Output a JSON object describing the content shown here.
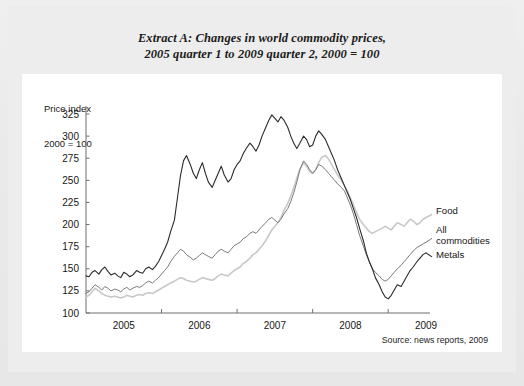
{
  "title": {
    "line1": "Extract A: Changes in world commodity prices,",
    "line2": "2005 quarter 1 to 2009 quarter 2, 2000 = 100"
  },
  "axis_caption": {
    "line1": "Price index",
    "line2": "2000 = 100"
  },
  "source": "Source: news reports, 2009",
  "chart_data": {
    "type": "line",
    "title": "Extract A: Changes in world commodity prices, 2005 quarter 1 to 2009 quarter 2, 2000 = 100",
    "xlabel": "",
    "ylabel": "Price index 2000 = 100",
    "ylim": [
      100,
      325
    ],
    "yticks": [
      100,
      125,
      150,
      175,
      200,
      225,
      250,
      275,
      300,
      325
    ],
    "xlim": [
      2005.0,
      2009.5
    ],
    "xticks": [
      2005,
      2006,
      2007,
      2008,
      2009
    ],
    "xtick_labels": [
      "2005",
      "2006",
      "2007",
      "2008",
      "2009"
    ],
    "grid": false,
    "legend_position": "inline-right",
    "series": [
      {
        "name": "Metals",
        "color": "#2b2b2b",
        "width": 1.1,
        "x": [
          2005.0,
          2005.04,
          2005.08,
          2005.12,
          2005.17,
          2005.21,
          2005.25,
          2005.29,
          2005.33,
          2005.38,
          2005.42,
          2005.46,
          2005.5,
          2005.54,
          2005.58,
          2005.62,
          2005.67,
          2005.71,
          2005.75,
          2005.79,
          2005.83,
          2005.88,
          2005.92,
          2005.96,
          2006.0,
          2006.04,
          2006.08,
          2006.12,
          2006.17,
          2006.21,
          2006.25,
          2006.29,
          2006.33,
          2006.38,
          2006.42,
          2006.46,
          2006.5,
          2006.54,
          2006.58,
          2006.62,
          2006.67,
          2006.71,
          2006.75,
          2006.79,
          2006.83,
          2006.88,
          2006.92,
          2006.96,
          2007.0,
          2007.04,
          2007.08,
          2007.12,
          2007.17,
          2007.21,
          2007.25,
          2007.29,
          2007.33,
          2007.38,
          2007.42,
          2007.46,
          2007.5,
          2007.54,
          2007.58,
          2007.62,
          2007.67,
          2007.71,
          2007.75,
          2007.79,
          2007.83,
          2007.88,
          2007.92,
          2007.96,
          2008.0,
          2008.04,
          2008.08,
          2008.12,
          2008.17,
          2008.21,
          2008.25,
          2008.29,
          2008.33,
          2008.38,
          2008.42,
          2008.46,
          2008.5,
          2008.54,
          2008.58,
          2008.62,
          2008.67,
          2008.71,
          2008.75,
          2008.79,
          2008.83,
          2008.88,
          2008.92,
          2008.96,
          2009.0,
          2009.04,
          2009.08,
          2009.12,
          2009.17,
          2009.21,
          2009.25,
          2009.29,
          2009.33,
          2009.38,
          2009.42,
          2009.46,
          2009.5
        ],
        "values": [
          142,
          141,
          146,
          148,
          144,
          149,
          152,
          147,
          143,
          145,
          142,
          140,
          146,
          144,
          141,
          143,
          148,
          146,
          145,
          150,
          152,
          149,
          153,
          158,
          165,
          172,
          180,
          192,
          205,
          230,
          255,
          272,
          278,
          268,
          258,
          252,
          262,
          270,
          258,
          248,
          242,
          250,
          258,
          266,
          256,
          248,
          252,
          262,
          268,
          272,
          280,
          286,
          292,
          288,
          283,
          290,
          300,
          310,
          318,
          324,
          320,
          316,
          322,
          318,
          310,
          300,
          292,
          286,
          292,
          300,
          296,
          288,
          290,
          300,
          306,
          302,
          296,
          288,
          280,
          272,
          262,
          252,
          244,
          236,
          228,
          218,
          208,
          196,
          182,
          168,
          158,
          150,
          140,
          132,
          124,
          118,
          116,
          120,
          126,
          132,
          130,
          136,
          142,
          148,
          152,
          158,
          162,
          166,
          168
        ]
      },
      {
        "name": "All commodities",
        "color": "#7a7a7a",
        "width": 1.0,
        "x": [
          2005.0,
          2005.04,
          2005.08,
          2005.12,
          2005.17,
          2005.21,
          2005.25,
          2005.29,
          2005.33,
          2005.38,
          2005.42,
          2005.46,
          2005.5,
          2005.54,
          2005.58,
          2005.62,
          2005.67,
          2005.71,
          2005.75,
          2005.79,
          2005.83,
          2005.88,
          2005.92,
          2005.96,
          2006.0,
          2006.04,
          2006.08,
          2006.12,
          2006.17,
          2006.21,
          2006.25,
          2006.29,
          2006.33,
          2006.38,
          2006.42,
          2006.46,
          2006.5,
          2006.54,
          2006.58,
          2006.62,
          2006.67,
          2006.71,
          2006.75,
          2006.79,
          2006.83,
          2006.88,
          2006.92,
          2006.96,
          2007.0,
          2007.04,
          2007.08,
          2007.12,
          2007.17,
          2007.21,
          2007.25,
          2007.29,
          2007.33,
          2007.38,
          2007.42,
          2007.46,
          2007.5,
          2007.54,
          2007.58,
          2007.62,
          2007.67,
          2007.71,
          2007.75,
          2007.79,
          2007.83,
          2007.88,
          2007.92,
          2007.96,
          2008.0,
          2008.04,
          2008.08,
          2008.12,
          2008.17,
          2008.21,
          2008.25,
          2008.29,
          2008.33,
          2008.38,
          2008.42,
          2008.46,
          2008.5,
          2008.54,
          2008.58,
          2008.62,
          2008.67,
          2008.71,
          2008.75,
          2008.79,
          2008.83,
          2008.88,
          2008.92,
          2008.96,
          2009.0,
          2009.04,
          2009.08,
          2009.12,
          2009.17,
          2009.21,
          2009.25,
          2009.29,
          2009.33,
          2009.38,
          2009.42,
          2009.46,
          2009.5
        ],
        "values": [
          122,
          124,
          128,
          132,
          129,
          126,
          130,
          128,
          125,
          127,
          126,
          124,
          127,
          129,
          126,
          128,
          130,
          129,
          131,
          134,
          136,
          134,
          137,
          140,
          144,
          148,
          152,
          158,
          164,
          168,
          172,
          170,
          166,
          163,
          160,
          162,
          165,
          168,
          166,
          164,
          162,
          166,
          170,
          172,
          170,
          168,
          172,
          176,
          178,
          180,
          184,
          186,
          190,
          192,
          190,
          194,
          198,
          202,
          206,
          208,
          205,
          202,
          206,
          212,
          218,
          226,
          236,
          248,
          262,
          272,
          268,
          262,
          258,
          262,
          268,
          266,
          262,
          258,
          254,
          250,
          246,
          242,
          238,
          230,
          222,
          212,
          200,
          188,
          176,
          166,
          158,
          150,
          146,
          142,
          138,
          136,
          138,
          142,
          146,
          150,
          154,
          158,
          162,
          166,
          170,
          174,
          176,
          178,
          180
        ]
      },
      {
        "name": "Food",
        "color": "#c8c8c8",
        "width": 1.6,
        "x": [
          2005.0,
          2005.04,
          2005.08,
          2005.12,
          2005.17,
          2005.21,
          2005.25,
          2005.29,
          2005.33,
          2005.38,
          2005.42,
          2005.46,
          2005.5,
          2005.54,
          2005.58,
          2005.62,
          2005.67,
          2005.71,
          2005.75,
          2005.79,
          2005.83,
          2005.88,
          2005.92,
          2005.96,
          2006.0,
          2006.04,
          2006.08,
          2006.12,
          2006.17,
          2006.21,
          2006.25,
          2006.29,
          2006.33,
          2006.38,
          2006.42,
          2006.46,
          2006.5,
          2006.54,
          2006.58,
          2006.62,
          2006.67,
          2006.71,
          2006.75,
          2006.79,
          2006.83,
          2006.88,
          2006.92,
          2006.96,
          2007.0,
          2007.04,
          2007.08,
          2007.12,
          2007.17,
          2007.21,
          2007.25,
          2007.29,
          2007.33,
          2007.38,
          2007.42,
          2007.46,
          2007.5,
          2007.54,
          2007.58,
          2007.62,
          2007.67,
          2007.71,
          2007.75,
          2007.79,
          2007.83,
          2007.88,
          2007.92,
          2007.96,
          2008.0,
          2008.04,
          2008.08,
          2008.12,
          2008.17,
          2008.21,
          2008.25,
          2008.29,
          2008.33,
          2008.38,
          2008.42,
          2008.46,
          2008.5,
          2008.54,
          2008.58,
          2008.62,
          2008.67,
          2008.71,
          2008.75,
          2008.79,
          2008.83,
          2008.88,
          2008.92,
          2008.96,
          2009.0,
          2009.04,
          2009.08,
          2009.12,
          2009.17,
          2009.21,
          2009.25,
          2009.29,
          2009.33,
          2009.38,
          2009.42,
          2009.46,
          2009.5
        ],
        "values": [
          118,
          120,
          124,
          128,
          125,
          122,
          120,
          119,
          118,
          119,
          118,
          117,
          118,
          120,
          119,
          118,
          120,
          121,
          120,
          122,
          123,
          122,
          124,
          126,
          128,
          130,
          132,
          134,
          136,
          138,
          140,
          139,
          137,
          136,
          135,
          136,
          138,
          140,
          139,
          138,
          137,
          139,
          142,
          144,
          143,
          142,
          145,
          148,
          150,
          152,
          156,
          158,
          162,
          166,
          168,
          172,
          176,
          182,
          188,
          194,
          198,
          202,
          208,
          216,
          224,
          232,
          242,
          252,
          262,
          270,
          266,
          260,
          258,
          262,
          270,
          276,
          278,
          274,
          268,
          262,
          256,
          250,
          244,
          238,
          230,
          222,
          214,
          206,
          200,
          196,
          192,
          190,
          192,
          194,
          196,
          198,
          196,
          194,
          198,
          202,
          200,
          198,
          202,
          206,
          204,
          200,
          202,
          206,
          208
        ]
      }
    ]
  },
  "series_labels": [
    {
      "name": "Food",
      "text": "Food"
    },
    {
      "name": "All commodities",
      "text_line1": "All",
      "text_line2": "commodities"
    },
    {
      "name": "Metals",
      "text": "Metals"
    }
  ]
}
